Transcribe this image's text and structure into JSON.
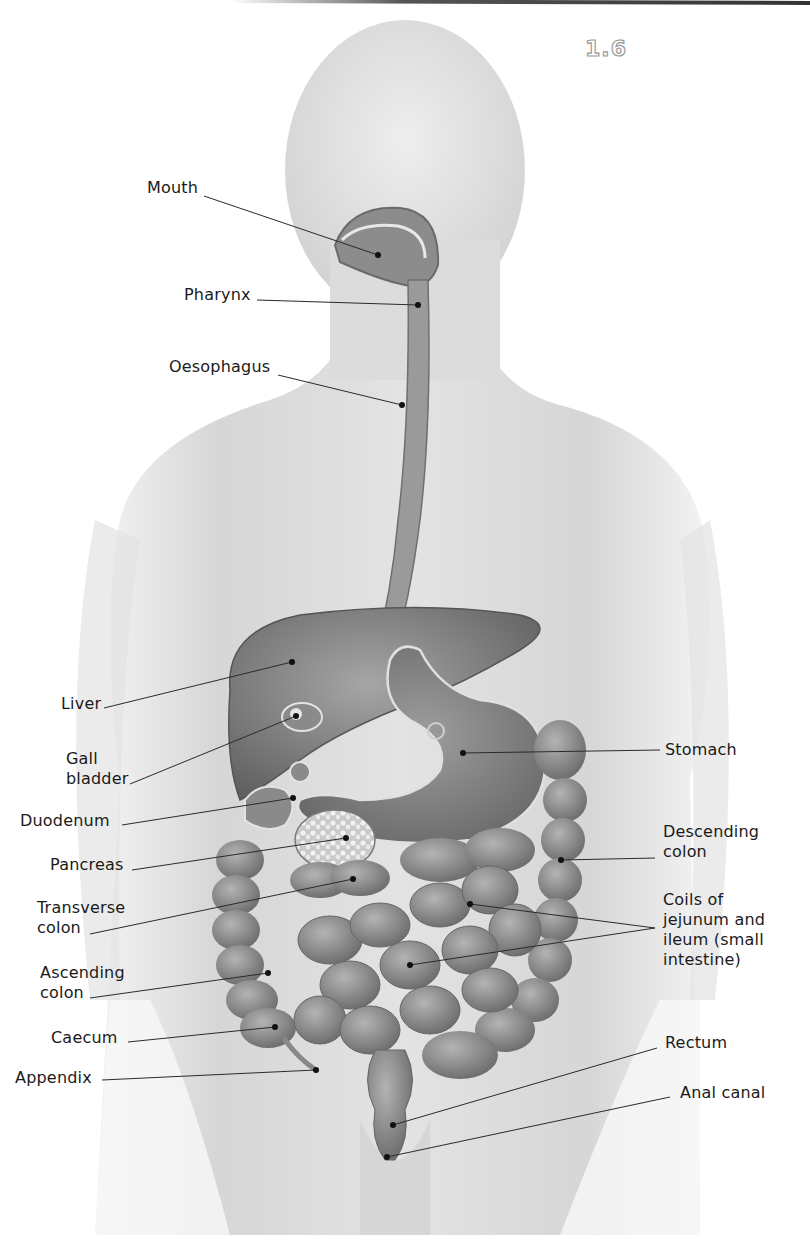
{
  "figure": {
    "number": "1.6",
    "colors": {
      "body_skin": "#d8d8d8",
      "organ_dark": "#6e6e6e",
      "organ_mid": "#8a8a8a",
      "organ_light": "#a9a9a9",
      "leader_line": "#2a2a2a",
      "label_text": "#1a1a1a"
    }
  },
  "labels": [
    {
      "id": "mouth",
      "text": "Mouth",
      "x": 147,
      "y": 178,
      "anchor": [
        204,
        196
      ],
      "point": [
        378,
        255
      ]
    },
    {
      "id": "pharynx",
      "text": "Pharynx",
      "x": 184,
      "y": 285,
      "anchor": [
        257,
        300
      ],
      "point": [
        418,
        305
      ]
    },
    {
      "id": "oesophagus",
      "text": "Oesophagus",
      "x": 169,
      "y": 357,
      "anchor": [
        278,
        375
      ],
      "point": [
        402,
        405
      ]
    },
    {
      "id": "liver",
      "text": "Liver",
      "x": 61,
      "y": 694,
      "anchor": [
        104,
        708
      ],
      "point": [
        292,
        662
      ]
    },
    {
      "id": "gall-bladder",
      "text": "Gall\nbladder",
      "x": 66,
      "y": 749,
      "anchor": [
        130,
        784
      ],
      "point": [
        296,
        716
      ]
    },
    {
      "id": "duodenum",
      "text": "Duodenum",
      "x": 20,
      "y": 811,
      "anchor": [
        122,
        825
      ],
      "point": [
        293,
        798
      ]
    },
    {
      "id": "pancreas",
      "text": "Pancreas",
      "x": 50,
      "y": 855,
      "anchor": [
        132,
        870
      ],
      "point": [
        346,
        838
      ]
    },
    {
      "id": "transverse-colon",
      "text": "Transverse\ncolon",
      "x": 37,
      "y": 898,
      "anchor": [
        90,
        934
      ],
      "point": [
        353,
        879
      ]
    },
    {
      "id": "ascending-colon",
      "text": "Ascending\ncolon",
      "x": 40,
      "y": 963,
      "anchor": [
        90,
        998
      ],
      "point": [
        268,
        973
      ]
    },
    {
      "id": "caecum",
      "text": "Caecum",
      "x": 51,
      "y": 1028,
      "anchor": [
        128,
        1042
      ],
      "point": [
        275,
        1027
      ]
    },
    {
      "id": "appendix",
      "text": "Appendix",
      "x": 15,
      "y": 1068,
      "anchor": [
        102,
        1080
      ],
      "point": [
        316,
        1070
      ]
    },
    {
      "id": "stomach",
      "text": "Stomach",
      "x": 665,
      "y": 740,
      "anchor": [
        660,
        750
      ],
      "point": [
        463,
        753
      ]
    },
    {
      "id": "descending-colon",
      "text": "Descending\ncolon",
      "x": 663,
      "y": 822,
      "anchor": [
        655,
        858
      ],
      "point": [
        561,
        860
      ]
    },
    {
      "id": "coils",
      "text": "Coils of\njejunum and\nileum (small\nintestine)",
      "x": 663,
      "y": 890,
      "anchor": [
        655,
        928
      ],
      "point": [
        470,
        904
      ],
      "point2": [
        410,
        965
      ]
    },
    {
      "id": "rectum",
      "text": "Rectum",
      "x": 665,
      "y": 1033,
      "anchor": [
        657,
        1048
      ],
      "point": [
        393,
        1125
      ]
    },
    {
      "id": "anal-canal",
      "text": "Anal canal",
      "x": 680,
      "y": 1083,
      "anchor": [
        670,
        1097
      ],
      "point": [
        387,
        1157
      ]
    }
  ]
}
